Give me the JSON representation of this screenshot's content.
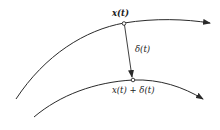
{
  "diagram": {
    "labels": {
      "x_t": "x(t)",
      "delta_t": "δ(t)",
      "x_plus_delta": "x(t) + δ(t)"
    },
    "colors": {
      "stroke": "#2a2a2a",
      "background": "#ffffff"
    },
    "elements": {
      "upper_trajectory": "trajectory x(t)",
      "lower_trajectory": "perturbed trajectory x(t)+δ(t)",
      "perturbation_vector": "δ(t)"
    }
  }
}
